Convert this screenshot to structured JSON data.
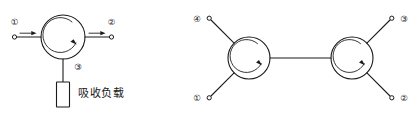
{
  "figure": {
    "background_color": "#ffffff",
    "line_color": "#1a1a1a",
    "diagrams": [
      {
        "id": "single-circulator",
        "name": "three-port-circulator-with-matched-load",
        "circulation_direction": "clockwise",
        "ports": [
          {
            "number": "①",
            "label_text": "①",
            "position": "left",
            "signal": "input",
            "arrow": "into-circulator"
          },
          {
            "number": "②",
            "label_text": "②",
            "position": "right",
            "signal": "output",
            "arrow": "out-of-circulator"
          },
          {
            "number": "③",
            "label_text": "③",
            "position": "bottom",
            "signal": "terminated",
            "arrow": "none"
          }
        ],
        "terminator": {
          "name": "absorbing-load",
          "label": "吸收负载",
          "shape": "rectangle",
          "attached_to_port": "③"
        }
      },
      {
        "id": "dual-circulator",
        "name": "two-cascaded-circulators",
        "circulation_direction": "clockwise",
        "link": {
          "name": "interconnect-line",
          "orientation": "horizontal"
        },
        "ports": [
          {
            "number": "④",
            "label_text": "④",
            "position": "top-left",
            "circulator": "left"
          },
          {
            "number": "①",
            "label_text": "①",
            "position": "bottom-left",
            "circulator": "left"
          },
          {
            "number": "③",
            "label_text": "③",
            "position": "top-right",
            "circulator": "right"
          },
          {
            "number": "②",
            "label_text": "②",
            "position": "bottom-right",
            "circulator": "right"
          }
        ]
      }
    ]
  }
}
